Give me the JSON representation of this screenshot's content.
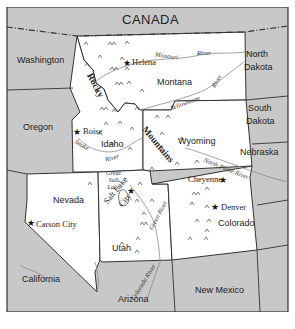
{
  "map": {
    "title": "Rocky Mountain States",
    "colors": {
      "region_highlight": "#ffffff",
      "surrounding": "#c8c8c8",
      "border": "#333333",
      "river": "#8a8a8a",
      "text": "#222222"
    },
    "countries": [
      {
        "name": "CANADA"
      }
    ],
    "states_highlighted": [
      {
        "name": "Montana"
      },
      {
        "name": "Idaho"
      },
      {
        "name": "Wyoming"
      },
      {
        "name": "Nevada"
      },
      {
        "name": "Utah"
      },
      {
        "name": "Colorado"
      }
    ],
    "states_surrounding": [
      {
        "name": "Washington"
      },
      {
        "name": "Oregon"
      },
      {
        "name": "California"
      },
      {
        "name": "Arizona"
      },
      {
        "name": "New Mexico"
      },
      {
        "name": "North Dakota",
        "line1": "North",
        "line2": "Dakota"
      },
      {
        "name": "South Dakota",
        "line1": "South",
        "line2": "Dakota"
      },
      {
        "name": "Nebraska"
      }
    ],
    "capitals": [
      {
        "name": "Helena",
        "symbol": "★"
      },
      {
        "name": "Boise",
        "symbol": "★"
      },
      {
        "name": "Cheyenne",
        "symbol": "★"
      },
      {
        "name": "Denver",
        "symbol": "★"
      },
      {
        "name": "Carson City",
        "symbol": "★"
      },
      {
        "name": "Salt Lake City",
        "line1": "Salt Lake",
        "line2": "City",
        "symbol": "★"
      }
    ],
    "water": [
      {
        "name": "Great Salt Lake",
        "line1": "Great",
        "line2": "Salt",
        "line3": "Lake"
      }
    ],
    "rivers": [
      {
        "name": "Missouri River",
        "part1": "Missouri",
        "part2": "River"
      },
      {
        "name": "Yellowstone River",
        "part1": "Yellowstone",
        "part2": "River"
      },
      {
        "name": "Snake River",
        "part1": "Snake",
        "part2": "River"
      },
      {
        "name": "North Platte River",
        "label": "North Platte River"
      },
      {
        "name": "Green River",
        "label": "Green River"
      },
      {
        "name": "Colorado River",
        "label": "Colorado River"
      }
    ],
    "mountains": {
      "name": "Rocky Mountains",
      "part1": "Rocky",
      "part2": "Mountains",
      "symbol": "^"
    }
  }
}
